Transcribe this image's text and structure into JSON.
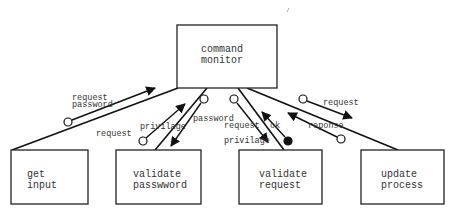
{
  "diagram": {
    "type": "structure-chart",
    "modules": {
      "command_monitor": {
        "line1": "command",
        "line2": "monitor"
      },
      "get_input": {
        "line1": "get",
        "line2": "input"
      },
      "validate_password": {
        "line1": "validate",
        "line2": "passwword"
      },
      "validate_request": {
        "line1": "validate",
        "line2": "request"
      },
      "update_process": {
        "line1": "update",
        "line2": "process"
      }
    },
    "couples": {
      "get_input_up_line1": "request",
      "get_input_up_line2": "password",
      "validate_password_up": "privilage",
      "validate_password_down": "password",
      "validate_password_request": "request",
      "validate_request_down_line1": "request",
      "validate_request_down_line2": "privilage",
      "validate_request_up": "ok",
      "update_process_down": "request",
      "update_process_up": "reponse"
    },
    "colors": {
      "stroke": "#111111",
      "text": "#333333",
      "background": "#ffffff"
    }
  }
}
